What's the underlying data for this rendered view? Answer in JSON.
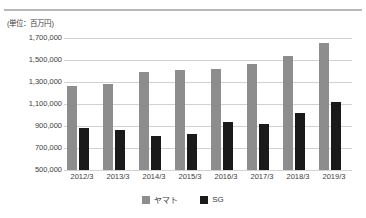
{
  "unit_label": "(単位：百万円)",
  "colors": {
    "yamato": "#8d8d8d",
    "sg": "#1a1a1a",
    "gridline": "#d2d2d2",
    "text": "#3c3c3c",
    "top_rule": "#b9b9b9"
  },
  "legend": {
    "position": "bottom-center",
    "items": [
      {
        "label": "ヤマト",
        "swatch": "#8d8d8d"
      },
      {
        "label": "SG",
        "swatch": "#1a1a1a"
      }
    ]
  },
  "chart_data": {
    "type": "bar",
    "title": "",
    "subtitle": "",
    "xlabel": "",
    "ylabel": "(単位：百万円)",
    "grid": true,
    "ylim": [
      500000,
      1700000
    ],
    "ytick_values": [
      1700000,
      1500000,
      1300000,
      1100000,
      900000,
      700000,
      500000
    ],
    "ytick_labels": [
      "1,700,000",
      "1,500,000",
      "1,300,000",
      "1,100,000",
      "900,000",
      "700,000",
      "500,000"
    ],
    "categories": [
      "2012/3",
      "2013/3",
      "2014/3",
      "2015/3",
      "2016/3",
      "2017/3",
      "2018/3",
      "2019/3"
    ],
    "series": [
      {
        "name": "ヤマト",
        "color": "#8d8d8d",
        "values": [
          1263000,
          1283000,
          1390000,
          1410000,
          1416000,
          1466000,
          1538000,
          1653000
        ]
      },
      {
        "name": "SG",
        "color": "#1a1a1a",
        "values": [
          880000,
          863000,
          809000,
          827000,
          936000,
          918000,
          1018000,
          1118000
        ]
      }
    ]
  }
}
